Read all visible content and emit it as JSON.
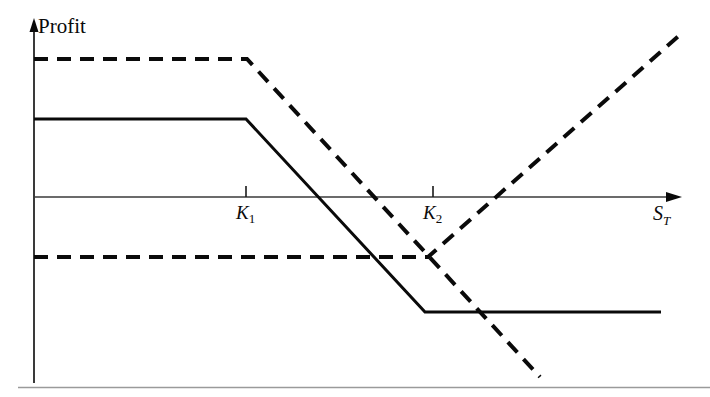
{
  "figure": {
    "title": "",
    "y_axis_label": "Profit",
    "x_axis_label_base": "S",
    "x_axis_label_sub": "T",
    "tick_labels": [
      {
        "base": "K",
        "sub": "1"
      },
      {
        "base": "K",
        "sub": "2"
      }
    ],
    "colors": {
      "ink": "#0a0a0a",
      "axis": "#2b2b2b",
      "background": "#ffffff",
      "rule": "#8a8a8a"
    }
  },
  "chart_data": {
    "type": "line",
    "title": "",
    "xlabel": "S_T",
    "ylabel": "Profit",
    "grid": false,
    "legend": "none",
    "axis_origin_px": {
      "x": 34,
      "y": 197
    },
    "x_axis_range_px": [
      34,
      682
    ],
    "y_axis_range_px": [
      21,
      383
    ],
    "x_ticks": [
      {
        "label": "K_1",
        "x_px": 246
      },
      {
        "label": "K_2",
        "x_px": 433
      }
    ],
    "annotations": [
      "Solid line: bear spread style payoff, flat positive to K_1, declining to K_2, flat negative after",
      "Dashed line: higher flat payoff to K_1 then declining through zero, with a separate lower flat segment rising after K_2"
    ],
    "series": [
      {
        "name": "solid-payoff",
        "style": "solid",
        "linewidth_px": 3,
        "points_px": [
          {
            "x": 34,
            "y": 119
          },
          {
            "x": 246,
            "y": 119
          },
          {
            "x": 425,
            "y": 312
          },
          {
            "x": 661,
            "y": 312
          }
        ],
        "points_data": [
          {
            "x": 0,
            "y": 78
          },
          {
            "x": 212,
            "y": 78
          },
          {
            "x": 391,
            "y": -115
          },
          {
            "x": 627,
            "y": -115
          }
        ]
      },
      {
        "name": "dashed-payoff-upper",
        "style": "dashed",
        "linewidth_px": 4,
        "dash_px": [
          14,
          9
        ],
        "points_px": [
          {
            "x": 34,
            "y": 59
          },
          {
            "x": 247,
            "y": 59
          },
          {
            "x": 540,
            "y": 377
          }
        ],
        "points_data": [
          {
            "x": 0,
            "y": 138
          },
          {
            "x": 213,
            "y": 138
          },
          {
            "x": 506,
            "y": -180
          }
        ]
      },
      {
        "name": "dashed-payoff-lower",
        "style": "dashed",
        "linewidth_px": 4,
        "dash_px": [
          14,
          9
        ],
        "points_px": [
          {
            "x": 34,
            "y": 257
          },
          {
            "x": 428,
            "y": 257
          },
          {
            "x": 682,
            "y": 33
          }
        ],
        "points_data": [
          {
            "x": 0,
            "y": -60
          },
          {
            "x": 394,
            "y": -60
          },
          {
            "x": 648,
            "y": 164
          }
        ]
      }
    ]
  },
  "footer": {
    "rule_visible": true
  }
}
